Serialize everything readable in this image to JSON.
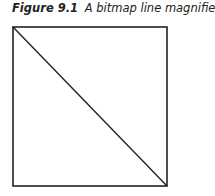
{
  "caption": {
    "label": "Figure 9.1",
    "title": "A bitmap line magnified"
  },
  "figure": {
    "shape": "square",
    "stroke_color": "#222222",
    "background": "#ffffff",
    "diagonal": {
      "from": "top-left",
      "to": "bottom-right"
    }
  }
}
